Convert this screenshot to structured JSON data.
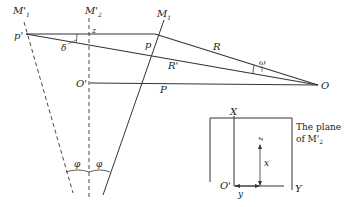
{
  "diagram": {
    "labels": {
      "m1_prime": "M'",
      "m1_prime_sub": "1",
      "m2_prime": "M'",
      "m2_prime_sub": "2",
      "m1": "M",
      "m1_sub": "1",
      "p_prime": "p'",
      "p": "p",
      "z": "z",
      "delta": "δ",
      "r": "R",
      "r_prime": "R'",
      "omega": "ω",
      "o": "O",
      "o_prime": "O'",
      "p_cap": "P",
      "phi_left": "φ",
      "phi_right": "φ"
    },
    "inset": {
      "x_axis": "X",
      "y_axis": "Y",
      "origin": "O'",
      "x_label": "x",
      "y_label": "y",
      "z_label": "z",
      "caption_line1": "The plane",
      "caption_line2": "of M'",
      "caption_sub": "2"
    },
    "colors": {
      "stroke": "#333333",
      "background": "#ffffff"
    }
  }
}
